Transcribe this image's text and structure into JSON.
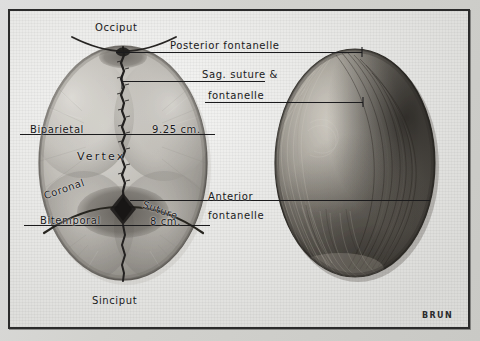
{
  "plate": {
    "title": "Fetal skull — vertex presentation, sutures and fontanelles",
    "signature": "BRUN",
    "paper_color": "#e9e9e6",
    "ink_color": "#18181a",
    "frame_color": "#2b2b2b"
  },
  "labels": {
    "occiput": "Occiput",
    "sinciput": "Sinciput",
    "vertex": "Vertex",
    "posterior_fontanelle": "Posterior  fontanelle",
    "sag_suture_line1": "Sag. suture &",
    "sag_suture_line2": "fontanelle",
    "anterior_fontanelle_line1": "Anterior",
    "anterior_fontanelle_line2": "fontanelle",
    "biparietal": "Biparietal",
    "biparietal_value": "9.25 cm.",
    "bitemporal": "Bitemporal",
    "bitemporal_value": "8 cm.",
    "coronal": "Coronal",
    "suture": "Suture"
  },
  "figures": {
    "left": "fetal-skull-bones-diagram",
    "right": "infant-head-with-hair-photo"
  },
  "measurements": [
    {
      "name": "Biparietal",
      "value": "9.25 cm."
    },
    {
      "name": "Bitemporal",
      "value": "8 cm."
    }
  ]
}
